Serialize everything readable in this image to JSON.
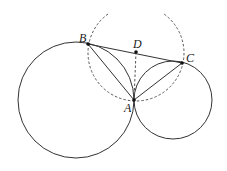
{
  "diagram": {
    "type": "geometry",
    "points": {
      "A": {
        "label": "A",
        "x": 134,
        "y": 100
      },
      "B": {
        "label": "B",
        "x": 88,
        "y": 44
      },
      "C": {
        "label": "C",
        "x": 182,
        "y": 63
      },
      "D": {
        "label": "D",
        "x": 136,
        "y": 52
      }
    },
    "circles": [
      {
        "name": "large-circle",
        "cx": 76,
        "cy": 100,
        "r": 58,
        "style": "solid"
      },
      {
        "name": "small-circle",
        "cx": 173,
        "cy": 100,
        "r": 39,
        "style": "solid"
      }
    ],
    "arcs": [
      {
        "name": "dashed-circle-arc",
        "center": "D",
        "r": 48,
        "style": "dashed"
      }
    ],
    "segments": [
      {
        "from": "B",
        "to": "C",
        "style": "solid"
      },
      {
        "from": "B",
        "to": "A",
        "style": "solid"
      },
      {
        "from": "A",
        "to": "C",
        "style": "solid"
      },
      {
        "from": "D",
        "to": "A",
        "style": "dashed"
      }
    ],
    "labels": {
      "A": "A",
      "B": "B",
      "C": "C",
      "D": "D"
    },
    "colors": {
      "stroke": "#333333",
      "dashed": "#555555",
      "point": "#111111"
    }
  }
}
